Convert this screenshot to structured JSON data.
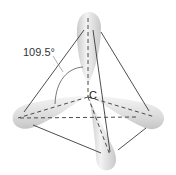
{
  "diagram": {
    "center_atom_label": "C",
    "bond_angle_label": "109.5°",
    "colors": {
      "background": "#ffffff",
      "orbital_fill": "#d9d9d9",
      "orbital_highlight": "#f7f7f7",
      "edge_line": "#3a3a3a",
      "text": "#333333"
    },
    "vertices": {
      "top": [
        88,
        30
      ],
      "left": [
        20,
        118
      ],
      "right": [
        155,
        117
      ],
      "bottom": [
        110,
        152
      ]
    },
    "center": [
      88,
      97
    ],
    "orbitals": [
      "top-lobe",
      "left-lobe",
      "right-lobe",
      "bottom-lobe"
    ]
  }
}
